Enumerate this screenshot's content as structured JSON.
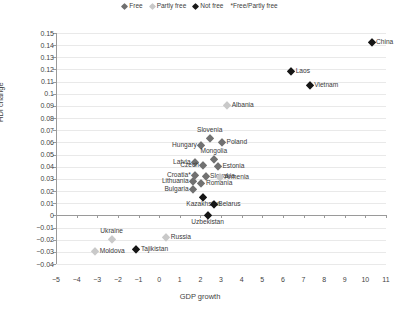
{
  "chart_data": {
    "type": "scatter",
    "title": "",
    "xlabel": "GDP growth",
    "ylabel": "HDI change",
    "xlim": [
      -5,
      11
    ],
    "ylim": [
      -0.04,
      0.15
    ],
    "grid": true,
    "legend_position": "top-center",
    "xticks": [
      "-5",
      "-4",
      "-3",
      "-2",
      "-1",
      "0",
      "1",
      "2",
      "3",
      "4",
      "5",
      "6",
      "7",
      "8",
      "9",
      "10",
      "11"
    ],
    "yticks": [
      "0.15",
      "0.14",
      "0.13",
      "0.12",
      "0.11",
      "0.1",
      "0.09",
      "0.08",
      "0.07",
      "0.06",
      "0.05",
      "0.04",
      "0.03",
      "0.02",
      "0.01",
      "0",
      "-0.01",
      "-0.02",
      "-0.03",
      "-0.04"
    ],
    "legend": [
      {
        "label": "Free",
        "marker": "diamond",
        "color": "#717171",
        "key": "free"
      },
      {
        "label": "Partly free",
        "marker": "diamond",
        "color": "#c9c9c9",
        "key": "partly"
      },
      {
        "label": "Not free",
        "marker": "diamond",
        "color": "#161616",
        "key": "notfree"
      },
      {
        "label": "*Free/Partly free",
        "marker": "none",
        "color": "#3a3a3a",
        "key": "note"
      }
    ],
    "points": [
      {
        "name": "China",
        "x": 10.3,
        "y": 0.1425,
        "group": "notfree",
        "label_pos": "right"
      },
      {
        "name": "Laos",
        "x": 6.4,
        "y": 0.1185,
        "group": "notfree",
        "label_pos": "right"
      },
      {
        "name": "Vietnam",
        "x": 7.3,
        "y": 0.1075,
        "group": "notfree",
        "label_pos": "right"
      },
      {
        "name": "Albania",
        "x": 3.3,
        "y": 0.0905,
        "group": "partly",
        "label_pos": "right"
      },
      {
        "name": "Slovenia",
        "x": 2.45,
        "y": 0.0635,
        "group": "free",
        "label_pos": "above"
      },
      {
        "name": "Poland",
        "x": 3.05,
        "y": 0.0605,
        "group": "free",
        "label_pos": "right"
      },
      {
        "name": "Hungary",
        "x": 2.05,
        "y": 0.0575,
        "group": "free",
        "label_pos": "left"
      },
      {
        "name": "Mongolia",
        "x": 2.65,
        "y": 0.0465,
        "group": "free",
        "label_pos": "above"
      },
      {
        "name": "Latvia",
        "x": 1.75,
        "y": 0.0435,
        "group": "free",
        "label_pos": "left"
      },
      {
        "name": "Czech",
        "x": 2.15,
        "y": 0.0415,
        "group": "free",
        "label_pos": "left"
      },
      {
        "name": "Estonia",
        "x": 2.85,
        "y": 0.0405,
        "group": "free",
        "label_pos": "right"
      },
      {
        "name": "Croatia*",
        "x": 1.75,
        "y": 0.0335,
        "group": "free",
        "label_pos": "left"
      },
      {
        "name": "Slovakia",
        "x": 2.25,
        "y": 0.0325,
        "group": "free",
        "label_pos": "right"
      },
      {
        "name": "Armenia",
        "x": 2.95,
        "y": 0.0315,
        "group": "partly",
        "label_pos": "right"
      },
      {
        "name": "Lithuania",
        "x": 1.65,
        "y": 0.0285,
        "group": "free",
        "label_pos": "left"
      },
      {
        "name": "Romania",
        "x": 2.05,
        "y": 0.0265,
        "group": "free",
        "label_pos": "right"
      },
      {
        "name": "Bulgaria",
        "x": 1.65,
        "y": 0.0215,
        "group": "free",
        "label_pos": "left"
      },
      {
        "name": "Kazakhstan",
        "x": 2.15,
        "y": 0.0155,
        "group": "notfree",
        "label_pos": "below"
      },
      {
        "name": "Belarus",
        "x": 2.65,
        "y": 0.0095,
        "group": "notfree",
        "label_pos": "right"
      },
      {
        "name": "Uzbekistan",
        "x": 2.35,
        "y": 0.0,
        "group": "notfree",
        "label_pos": "below"
      },
      {
        "name": "Russia",
        "x": 0.35,
        "y": -0.0175,
        "group": "partly",
        "label_pos": "right"
      },
      {
        "name": "Ukraine",
        "x": -2.3,
        "y": -0.0195,
        "group": "partly",
        "label_pos": "above"
      },
      {
        "name": "Tajikistan",
        "x": -1.1,
        "y": -0.0275,
        "group": "notfree",
        "label_pos": "right"
      },
      {
        "name": "Moldova",
        "x": -3.1,
        "y": -0.0295,
        "group": "partly",
        "label_pos": "right"
      }
    ]
  }
}
